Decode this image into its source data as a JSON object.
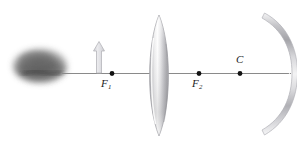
{
  "figure": {
    "background_color": "#ffffff",
    "width": 297,
    "height": 143,
    "axis": {
      "name": "principal-axis",
      "color": "#8a8a8a",
      "x_start": 62,
      "x_end": 291,
      "y": 73
    },
    "labels": {
      "f1": {
        "text": "F",
        "subscript": "1"
      },
      "f2": {
        "text": "F",
        "subscript": "2"
      },
      "c": {
        "text": "C",
        "subscript": ""
      }
    },
    "points": [
      {
        "name": "focal-point-f1",
        "x": 112,
        "y": 73,
        "label": "F1",
        "color": "#121212"
      },
      {
        "name": "focal-point-f2",
        "x": 199,
        "y": 73,
        "label": "F2",
        "color": "#121212"
      },
      {
        "name": "center-of-curvature-c",
        "x": 240,
        "y": 73,
        "label": "C",
        "color": "#121212"
      }
    ],
    "object_blob": {
      "name": "object-blob",
      "center_x": 40,
      "center_y": 66,
      "width": 58,
      "height": 38,
      "color": "#6e6e6e"
    },
    "object_arrow": {
      "name": "object-arrow",
      "x": 99,
      "base_y": 73,
      "tip_y": 42,
      "shaft_width": 5,
      "head_width": 11,
      "head_height": 9,
      "fill": "#e3e3e6",
      "stroke": "#b9b9bd"
    },
    "lens": {
      "name": "converging-lens",
      "center_x": 159,
      "top_y": 15,
      "bottom_y": 136,
      "half_width": 13,
      "fill_light": "#ffffff",
      "fill_mid": "#d6d6d8",
      "fill_dark": "#9a9a9e",
      "stroke": "#a8a8ac"
    },
    "mirror": {
      "name": "concave-mirror",
      "vertex_x": 291,
      "vertex_y": 73,
      "top_x": 262,
      "top_y": 18,
      "bottom_x": 262,
      "bottom_y": 130,
      "thickness": 6,
      "fill_light": "#fbfbfb",
      "fill_mid": "#cfcfd2",
      "fill_dark": "#8e8e92",
      "stroke": "#b4b4b8"
    }
  }
}
